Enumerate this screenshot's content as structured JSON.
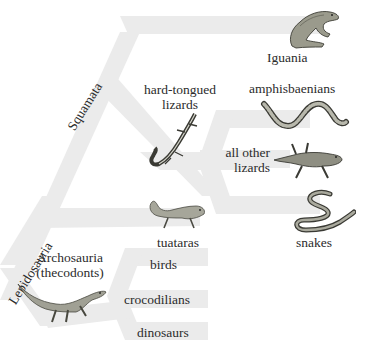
{
  "diagram": {
    "type": "cladogram",
    "band_color": "#ebebeb",
    "background": "#ffffff",
    "text_color": "#2b2b2b",
    "clades": {
      "lepidosauria": "Lepidosauria",
      "squamata": "Squamata",
      "archosauria_line1": "Archosauria",
      "archosauria_line2": "(thecodonts)"
    },
    "taxa": {
      "iguania": "Iguania",
      "hard_tongued_line1": "hard-tongued",
      "hard_tongued_line2": "lizards",
      "amphisbaenians": "amphisbaenians",
      "all_other_line1": "all other",
      "all_other_line2": "lizards",
      "tuataras": "tuataras",
      "snakes": "snakes",
      "birds": "birds",
      "crocodilians": "crocodilians",
      "dinosaurs": "dinosaurs"
    },
    "illustrations": [
      "iguana",
      "striped-lizard",
      "amphisbaenian",
      "gecko-lizard",
      "tuatara",
      "snake",
      "thecodont"
    ]
  }
}
